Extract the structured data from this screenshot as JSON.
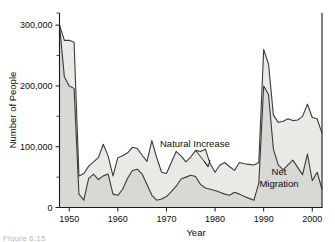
{
  "chart_data": {
    "type": "area",
    "title": "",
    "xlabel": "Year",
    "ylabel": "Number of People",
    "xlim": [
      1948,
      2002
    ],
    "ylim": [
      0,
      320000
    ],
    "xticks": [
      1950,
      1960,
      1970,
      1980,
      1990,
      2000
    ],
    "xtick_labels": [
      "1950",
      "1960",
      "1970",
      "1980",
      "1990",
      "2000"
    ],
    "yticks": [
      0,
      100000,
      200000,
      300000
    ],
    "ytick_labels": [
      "0",
      "100,000",
      "200,000",
      "300,000"
    ],
    "yminor_ticks": [
      50000,
      150000,
      250000,
      320000
    ],
    "grid": false,
    "legend_position": "inline-annotations",
    "stacked": true,
    "x": [
      1948,
      1949,
      1950,
      1951,
      1952,
      1953,
      1954,
      1955,
      1956,
      1957,
      1958,
      1959,
      1960,
      1961,
      1962,
      1963,
      1964,
      1965,
      1966,
      1967,
      1968,
      1969,
      1970,
      1971,
      1972,
      1973,
      1974,
      1975,
      1976,
      1977,
      1978,
      1979,
      1980,
      1981,
      1982,
      1983,
      1984,
      1985,
      1986,
      1987,
      1988,
      1989,
      1990,
      1991,
      1992,
      1993,
      1994,
      1995,
      1996,
      1997,
      1998,
      1999,
      2000,
      2001,
      2002
    ],
    "series": [
      {
        "name": "Net Migration",
        "color": "#d8d8d4",
        "values": [
          300000,
          215000,
          200000,
          196000,
          22000,
          12000,
          48000,
          55000,
          46000,
          52000,
          55000,
          22000,
          20000,
          30000,
          48000,
          61000,
          63000,
          55000,
          38000,
          20000,
          12000,
          14000,
          18000,
          26000,
          35000,
          47000,
          50000,
          53000,
          51000,
          38000,
          32000,
          30000,
          28000,
          25000,
          22000,
          20000,
          25000,
          22000,
          18000,
          15000,
          12000,
          40000,
          200000,
          186000,
          96000,
          70000,
          62000,
          70000,
          78000,
          66000,
          54000,
          88000,
          44000,
          58000,
          30000
        ],
        "annotation": "Net\nMigration"
      },
      {
        "name": "Natural Increase",
        "color": "#e9e9e6",
        "values": [
          0,
          60000,
          75000,
          76000,
          30000,
          44000,
          20000,
          20000,
          36000,
          52000,
          30000,
          30000,
          62000,
          55000,
          42000,
          38000,
          34000,
          31000,
          38000,
          90000,
          70000,
          44000,
          38000,
          48000,
          57000,
          38000,
          25000,
          30000,
          43000,
          54000,
          64000,
          42000,
          30000,
          45000,
          52000,
          47000,
          36000,
          52000,
          54000,
          56000,
          58000,
          34000,
          60000,
          50000,
          56000,
          70000,
          80000,
          76000,
          65000,
          78000,
          96000,
          82000,
          104000,
          88000,
          92000
        ],
        "annotation": "Natural Increase"
      }
    ],
    "annotations": [
      {
        "text": "Natural Increase",
        "x_px": 160,
        "y_px": 144,
        "leader_to_x_px": 208,
        "leader_to_y_px": 168
      },
      {
        "text": "Net",
        "x_px": 279,
        "y_px": 172
      },
      {
        "text": "Migration",
        "x_px": 279,
        "y_px": 184
      }
    ]
  },
  "caption": {
    "text": "Figure 6.15"
  }
}
